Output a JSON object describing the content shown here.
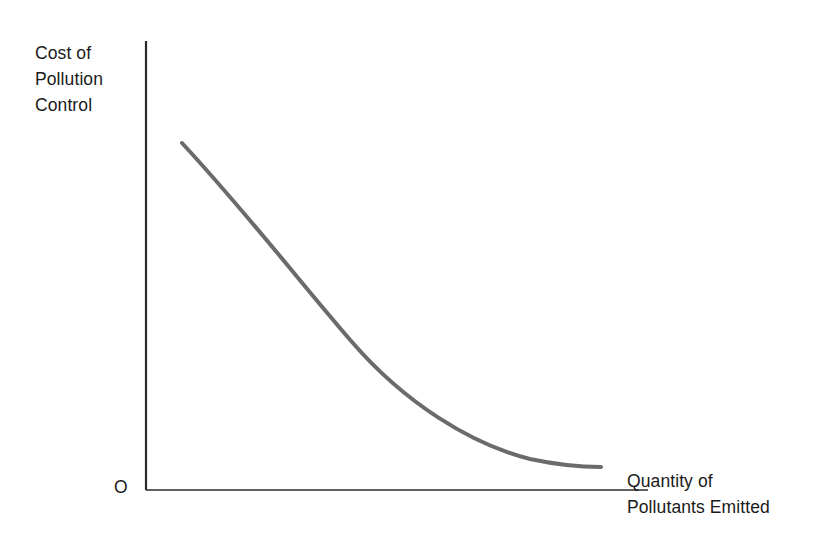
{
  "figure": {
    "background_color": "#ffffff",
    "width": 829,
    "height": 555
  },
  "axes": {
    "origin_label": "O",
    "axis_color": "#2a2a2a",
    "y_axis": {
      "label_lines": [
        "Cost of",
        "Pollution",
        "Control"
      ],
      "label_full": "Cost of Pollution Control"
    },
    "x_axis": {
      "label_lines": [
        "Quantity of",
        "Pollutants Emitted"
      ],
      "label_full": "Quantity of Pollutants Emitted"
    }
  },
  "chart_data": {
    "type": "line",
    "title": "",
    "subtitle": "",
    "xlabel": "Quantity of Pollutants Emitted",
    "ylabel": "Cost of Pollution Control",
    "grid": false,
    "legend": null,
    "legend_position": "none",
    "xlim": [
      0,
      100
    ],
    "ylim": [
      0,
      100
    ],
    "xticks": [],
    "yticks": [],
    "xticklabels": [],
    "yticklabels": [],
    "annotations": [
      "O"
    ],
    "series": [
      {
        "name": "Cost of pollution control",
        "color": "#6b6b6b",
        "line_width": 4,
        "shape": "convex decreasing",
        "x": [
          7,
          14,
          21,
          28,
          35,
          42,
          49,
          56,
          63,
          70,
          77,
          84,
          91
        ],
        "y": [
          77,
          70,
          63,
          56,
          49,
          42,
          36,
          30,
          24,
          18,
          13,
          9,
          5
        ]
      }
    ]
  }
}
